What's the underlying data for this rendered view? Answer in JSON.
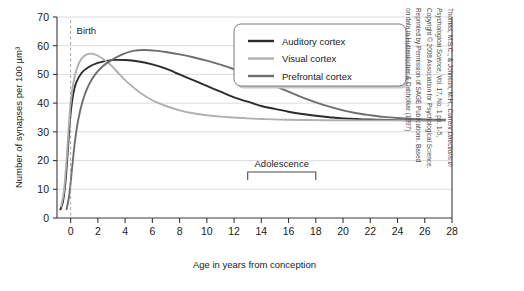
{
  "chart_data": {
    "type": "line",
    "title": "",
    "xlabel": "Age in years from conception",
    "ylabel": "Number of synapses per 100 µm³",
    "xlim": [
      -1,
      28
    ],
    "ylim": [
      0,
      70
    ],
    "xticks": [
      0,
      2,
      4,
      6,
      8,
      10,
      12,
      14,
      16,
      18,
      20,
      22,
      24,
      26,
      28
    ],
    "yticks": [
      0,
      10,
      20,
      30,
      40,
      50,
      60,
      70
    ],
    "grid": "horizontal",
    "legend_position": "top-right",
    "series": [
      {
        "name": "Auditory cortex",
        "color": "#2b2b2b",
        "points": [
          [
            -0.75,
            3
          ],
          [
            -0.55,
            6
          ],
          [
            -0.35,
            14
          ],
          [
            -0.2,
            24
          ],
          [
            -0.05,
            34
          ],
          [
            0.15,
            42
          ],
          [
            0.4,
            47
          ],
          [
            0.8,
            50.5
          ],
          [
            1.3,
            52.5
          ],
          [
            2,
            54
          ],
          [
            3,
            55
          ],
          [
            4,
            55
          ],
          [
            5,
            54.5
          ],
          [
            6,
            53.5
          ],
          [
            7,
            52
          ],
          [
            8,
            50
          ],
          [
            9,
            48
          ],
          [
            10,
            46
          ],
          [
            11,
            44
          ],
          [
            12,
            42
          ],
          [
            13,
            40.5
          ],
          [
            14,
            39
          ],
          [
            15,
            38
          ],
          [
            16,
            37
          ],
          [
            17,
            36.2
          ],
          [
            18,
            35.6
          ],
          [
            19,
            35.1
          ],
          [
            20,
            34.7
          ],
          [
            22,
            34.3
          ],
          [
            24,
            34.1
          ],
          [
            26,
            34
          ],
          [
            27.5,
            34
          ]
        ]
      },
      {
        "name": "Visual cortex",
        "color": "#b0b0b0",
        "points": [
          [
            -0.7,
            4
          ],
          [
            -0.5,
            9
          ],
          [
            -0.3,
            20
          ],
          [
            -0.15,
            31
          ],
          [
            0,
            40
          ],
          [
            0.2,
            47
          ],
          [
            0.45,
            52
          ],
          [
            0.8,
            55.5
          ],
          [
            1.2,
            57
          ],
          [
            1.6,
            57.2
          ],
          [
            2,
            56.5
          ],
          [
            2.5,
            55
          ],
          [
            3,
            53
          ],
          [
            3.5,
            50.5
          ],
          [
            4,
            48
          ],
          [
            5,
            44
          ],
          [
            6,
            41
          ],
          [
            7,
            39
          ],
          [
            8,
            37.5
          ],
          [
            9,
            36.5
          ],
          [
            10,
            35.8
          ],
          [
            11,
            35.3
          ],
          [
            12,
            35
          ],
          [
            13,
            34.7
          ],
          [
            14,
            34.5
          ],
          [
            16,
            34.2
          ],
          [
            18,
            34.1
          ],
          [
            20,
            34
          ],
          [
            24,
            34
          ],
          [
            27.5,
            34
          ]
        ]
      },
      {
        "name": "Prefrontal cortex",
        "color": "#6e6e6e",
        "points": [
          [
            -0.3,
            3
          ],
          [
            -0.1,
            8
          ],
          [
            0.1,
            17
          ],
          [
            0.3,
            26
          ],
          [
            0.55,
            34
          ],
          [
            0.9,
            41
          ],
          [
            1.3,
            46
          ],
          [
            1.8,
            50
          ],
          [
            2.4,
            53
          ],
          [
            3,
            55
          ],
          [
            3.8,
            57
          ],
          [
            4.6,
            58.2
          ],
          [
            5.4,
            58.5
          ],
          [
            6.2,
            58.3
          ],
          [
            7,
            57.8
          ],
          [
            8,
            57
          ],
          [
            9,
            56
          ],
          [
            10,
            54.8
          ],
          [
            11,
            53.4
          ],
          [
            12,
            51.8
          ],
          [
            13,
            50
          ],
          [
            14,
            48
          ],
          [
            15,
            46
          ],
          [
            16,
            44
          ],
          [
            17,
            42
          ],
          [
            18,
            40.3
          ],
          [
            19,
            38.8
          ],
          [
            20,
            37.5
          ],
          [
            21,
            36.5
          ],
          [
            22,
            35.8
          ],
          [
            23,
            35.2
          ],
          [
            24,
            34.8
          ],
          [
            25,
            34.5
          ],
          [
            26,
            34.3
          ],
          [
            27.5,
            34.2
          ]
        ]
      }
    ],
    "annotations": [
      {
        "name": "birth",
        "label": "Birth",
        "x": 0,
        "style": "dashed-vertical-line"
      },
      {
        "name": "adolescence",
        "label": "Adolescence",
        "x_start": 13,
        "x_end": 18,
        "y": 16,
        "style": "bracket"
      }
    ]
  },
  "legend": {
    "items": [
      {
        "label": "Auditory cortex"
      },
      {
        "label": "Visual cortex"
      },
      {
        "label": "Prefrontal cortex"
      }
    ]
  },
  "credit": {
    "line1_prefix": "Thomas, M.S.C., & Johnson, M.H., ",
    "line1_italic": "Current Directions in",
    "line2_italic": "Psychological Science,",
    "line2_suffix": " Vol. 17, No. 1 pp. 1-5,",
    "line3": "Copyright © 2008 Association for Psychological Science.",
    "line4": "Reprinted by Permission of SAGE Publications.  Based",
    "line5": "on data in Huttenlocher & Dabholkar (1997)"
  }
}
